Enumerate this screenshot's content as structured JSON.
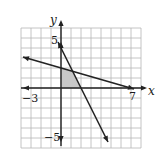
{
  "chart_data": {
    "type": "line",
    "title": "",
    "xlabel": "x",
    "ylabel": "y",
    "xlim": [
      -4,
      8
    ],
    "ylim": [
      -6,
      6
    ],
    "grid": true,
    "tick_labels": {
      "x": [
        {
          "value": -3,
          "label": "−3"
        },
        {
          "value": 7,
          "label": "7"
        }
      ],
      "y": [
        {
          "value": 5,
          "label": "5"
        },
        {
          "value": -5,
          "label": "−5"
        }
      ]
    },
    "series": [
      {
        "name": "steep-line",
        "equation": "y = -2x + 4",
        "points": [
          [
            -0.3,
            4.6
          ],
          [
            4.7,
            -5.4
          ]
        ],
        "arrows": "both"
      },
      {
        "name": "shallow-line",
        "equation": "2x + 7y = 14",
        "points": [
          [
            -3.8,
            3.1
          ],
          [
            7.3,
            -0.1
          ]
        ],
        "arrows": "both"
      }
    ],
    "shaded_region": {
      "vertices": [
        [
          0,
          0
        ],
        [
          2,
          0
        ],
        [
          1.17,
          1.67
        ],
        [
          0,
          2
        ]
      ],
      "color": "#c8c8c8"
    }
  },
  "colors": {
    "grid": "#b5b5b5",
    "axis": "#222222",
    "line": "#222222",
    "shade": "#c8c8c8"
  }
}
